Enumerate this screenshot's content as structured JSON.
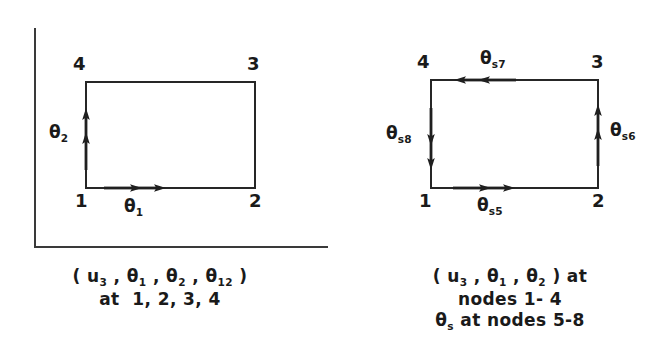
{
  "figure": {
    "background_color": "#ffffff",
    "line_color": "#262626"
  },
  "panels": [
    {
      "id": "left",
      "axes": {
        "visible": true,
        "style": "L-shaped frame"
      },
      "element": {
        "shape": "rectangle",
        "node_labels": {
          "top_left": "4",
          "top_right": "3",
          "bottom_left": "1",
          "bottom_right": "2"
        }
      },
      "arrows": [
        {
          "name": "theta-2-arrow",
          "label_main": "θ",
          "label_sub": "2",
          "direction": "up",
          "edge": "left"
        },
        {
          "name": "theta-1-arrow",
          "label_main": "θ",
          "label_sub": "1",
          "direction": "right",
          "edge": "bottom"
        }
      ],
      "caption": [
        "( u₃ , θ₁ , θ₂ , θ₁₂ )",
        "at  1, 2, 3, 4"
      ],
      "caption_parts": {
        "line1_pre": "( u",
        "line1_sub1": "3",
        "line1_mid1": " , θ",
        "line1_sub2": "1",
        "line1_mid2": " , θ",
        "line1_sub3": "2",
        "line1_mid3": " , θ",
        "line1_sub4": "12",
        "line1_post": " )",
        "line2": "at  1, 2, 3, 4"
      }
    },
    {
      "id": "right",
      "axes": {
        "visible": false,
        "style": "none"
      },
      "element": {
        "shape": "rectangle",
        "node_labels": {
          "top_left": "4",
          "top_right": "3",
          "bottom_left": "1",
          "bottom_right": "2"
        }
      },
      "arrows": [
        {
          "name": "theta-s7-arrow",
          "label_main": "θ",
          "label_sub": "s7",
          "direction": "left",
          "edge": "top"
        },
        {
          "name": "theta-s8-arrow",
          "label_main": "θ",
          "label_sub": "s8",
          "direction": "down",
          "edge": "left"
        },
        {
          "name": "theta-s6-arrow",
          "label_main": "θ",
          "label_sub": "s6",
          "direction": "up",
          "edge": "right"
        },
        {
          "name": "theta-s5-arrow",
          "label_main": "θ",
          "label_sub": "s5",
          "direction": "right",
          "edge": "bottom"
        }
      ],
      "caption": [
        "( u₃ , θ₁ , θ₂ ) at",
        "nodes 1- 4",
        "θₛ at nodes 5-8"
      ],
      "caption_parts": {
        "line1_pre": "( u",
        "line1_sub1": "3",
        "line1_mid1": " , θ",
        "line1_sub2": "1",
        "line1_mid2": " , θ",
        "line1_sub3": "2",
        "line1_post": " ) at",
        "line2": "nodes 1- 4",
        "line3_pre": "θ",
        "line3_sub": "s",
        "line3_post": " at nodes 5-8"
      }
    }
  ]
}
